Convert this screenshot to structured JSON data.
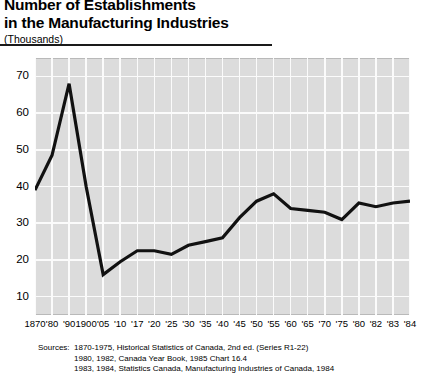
{
  "header": {
    "title_line1": "Number of Establishments",
    "title_line2": "in the Manufacturing Industries",
    "units": "(Thousands)"
  },
  "sources": {
    "label": "Sources:",
    "lines": [
      "1870-1975, Historical Statistics of Canada, 2nd ed. (Series R1-22)",
      "1980, 1982, Canada Year Book, 1985 Chart 16.4",
      "1983, 1984, Statistics Canada, Manufacturing Industries of Canada, 1984"
    ]
  },
  "chart_data": {
    "type": "line",
    "title": "Number of Establishments in the Manufacturing Industries",
    "subtitle": "(Thousands)",
    "xlabel": "",
    "ylabel": "",
    "ylim": [
      5,
      75
    ],
    "yticks": [
      10,
      20,
      30,
      40,
      50,
      60,
      70
    ],
    "grid": true,
    "legend": "none",
    "categories": [
      "1870",
      "'80",
      "'90",
      "1900",
      "'05",
      "'10",
      "'17",
      "'20",
      "'25",
      "'30",
      "'35",
      "'40",
      "'45",
      "'50",
      "'55",
      "'60",
      "'65",
      "'70",
      "'75",
      "'80",
      "'82",
      "'83",
      "'84"
    ],
    "values": [
      39,
      48.5,
      68,
      40,
      16,
      19.5,
      22.5,
      22.5,
      21.5,
      24,
      25,
      26,
      31.5,
      36,
      38,
      34,
      33.5,
      33,
      31,
      35.5,
      34.5,
      35.5,
      36
    ],
    "series": [
      {
        "name": "Number of Establishments",
        "values": [
          39,
          48.5,
          68,
          40,
          16,
          19.5,
          22.5,
          22.5,
          21.5,
          24,
          25,
          26,
          31.5,
          36,
          38,
          34,
          33.5,
          33,
          31,
          35.5,
          34.5,
          35.5,
          36
        ]
      }
    ],
    "line_color": "#111111",
    "plot_background": "#dcdcdc",
    "gridline_color": "#fbfbfb"
  }
}
